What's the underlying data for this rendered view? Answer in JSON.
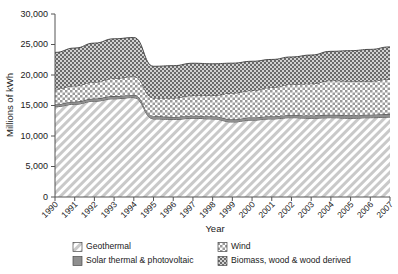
{
  "chart_data": {
    "type": "area",
    "title": "",
    "xlabel": "Year",
    "ylabel": "Millions of kWh",
    "categories": [
      1990,
      1991,
      1992,
      1993,
      1994,
      1995,
      1996,
      1997,
      1998,
      1999,
      2000,
      2001,
      2002,
      2003,
      2004,
      2005,
      2006,
      2007
    ],
    "x": [
      "1990",
      "1991",
      "1992",
      "1993",
      "1994",
      "1995",
      "1996",
      "1997",
      "1998",
      "1999",
      "2000",
      "2001",
      "2002",
      "2003",
      "2004",
      "2005",
      "2006",
      "2007"
    ],
    "ylim": [
      0,
      30000
    ],
    "yticks": [
      0,
      5000,
      10000,
      15000,
      20000,
      25000,
      30000
    ],
    "ytick_labels": [
      "0",
      "5,000",
      "10,000",
      "15,000",
      "20,000",
      "25,000",
      "30,000"
    ],
    "grid": false,
    "stacked": true,
    "legend_position": "bottom",
    "series": [
      {
        "name": "Geothermal",
        "pattern": "diagonal-hatch-light",
        "values": [
          14800,
          15200,
          15700,
          16100,
          16300,
          12800,
          12700,
          12900,
          12800,
          12300,
          12600,
          12800,
          13000,
          12900,
          13000,
          12900,
          13000,
          13100
        ]
      },
      {
        "name": "Solar thermal & photovoltaic",
        "pattern": "solid-gray",
        "values": [
          400,
          420,
          430,
          440,
          440,
          430,
          430,
          430,
          440,
          440,
          450,
          450,
          460,
          470,
          480,
          490,
          500,
          510
        ]
      },
      {
        "name": "Wind",
        "pattern": "dotted-checker-light",
        "values": [
          2500,
          2600,
          2700,
          2900,
          3000,
          3000,
          3100,
          3300,
          3400,
          4300,
          4400,
          4700,
          5000,
          5200,
          5600,
          5600,
          5500,
          5700
        ]
      },
      {
        "name": "Biomass, wood & wood derived",
        "pattern": "checkerboard-dark",
        "values": [
          6000,
          6200,
          6400,
          6500,
          6400,
          5200,
          5300,
          5300,
          5200,
          4900,
          4800,
          4600,
          4500,
          4700,
          4800,
          5000,
          5200,
          5300
        ]
      }
    ],
    "stack_tops": {
      "geothermal": [
        14800,
        15200,
        15700,
        16100,
        16300,
        12800,
        12700,
        12900,
        12800,
        12300,
        12600,
        12800,
        13000,
        12900,
        13000,
        12900,
        13000,
        13100
      ],
      "solar": [
        15200,
        15620,
        16130,
        16540,
        16740,
        13230,
        13130,
        13330,
        13240,
        12740,
        13050,
        13250,
        13460,
        13370,
        13480,
        13390,
        13500,
        13610
      ],
      "wind": [
        17700,
        18220,
        18830,
        19440,
        19740,
        16230,
        16230,
        16630,
        16640,
        17040,
        17450,
        17950,
        18460,
        18570,
        19080,
        18990,
        19000,
        19310
      ],
      "biomass_total": [
        23700,
        24420,
        25230,
        25940,
        26140,
        21430,
        21530,
        21930,
        21840,
        21940,
        22250,
        22550,
        22960,
        23270,
        23880,
        23990,
        24200,
        24610
      ]
    }
  },
  "legend": {
    "entries": [
      {
        "label": "Geothermal",
        "pattern": "diagonal-hatch-light"
      },
      {
        "label": "Wind",
        "pattern": "dotted-checker-light"
      },
      {
        "label": "Solar thermal & photovoltaic",
        "pattern": "solid-gray"
      },
      {
        "label": "Biomass, wood & wood derived",
        "pattern": "checkerboard-dark"
      }
    ]
  },
  "colors": {
    "geothermal": "#d9d9d9",
    "solar": "#8f8f8f",
    "wind": "#e8e8e8",
    "biomass": "#6e6e6e",
    "axis": "#555555",
    "text": "#1a1a1a"
  }
}
